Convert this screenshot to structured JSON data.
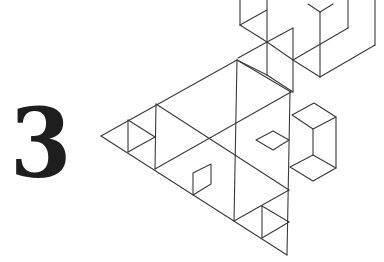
{
  "slide": {
    "number_label": "3",
    "colors": {
      "background": "#ffffff",
      "numeral": "#1e1e1e",
      "line_art": "#3a3a3a"
    }
  },
  "decoration": {
    "type": "isometric-line-art",
    "description": "Sierpinski-style triangle with isometric cubes and diamonds"
  }
}
